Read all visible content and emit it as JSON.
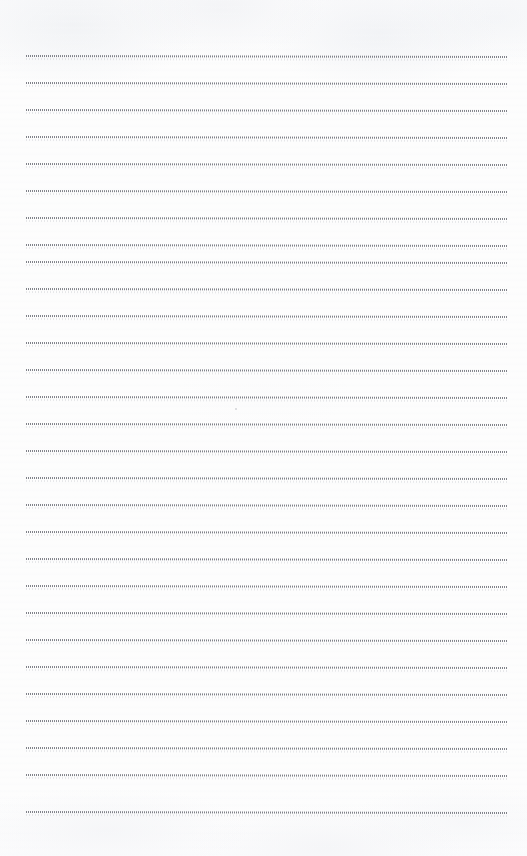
{
  "document": {
    "kind": "scanned-lined-paper",
    "title": "",
    "page_text": "",
    "header_text": "",
    "footer_text": "",
    "page_number": "",
    "annotation_text": "",
    "is_blank": "true"
  },
  "paper": {
    "width_px": 527,
    "height_px": 856,
    "background_color": "#fdfdfd",
    "texture_color": "#f0f1f4",
    "rule_color": "#767880",
    "rule_style": "fine-dotted",
    "rule_count": 29,
    "first_rule_y": 56,
    "rule_spacing_px": 27,
    "rule_left_x": 26,
    "rule_right_x": 507,
    "top_margin_px": 56,
    "bottom_margin_px": 44,
    "skew_deg": 0.12
  },
  "rules": [
    {
      "index": 1,
      "y": 56,
      "left": 26,
      "right": 507
    },
    {
      "index": 2,
      "y": 83,
      "left": 26,
      "right": 507
    },
    {
      "index": 3,
      "y": 110,
      "left": 26,
      "right": 507
    },
    {
      "index": 4,
      "y": 137,
      "left": 26,
      "right": 507
    },
    {
      "index": 5,
      "y": 164,
      "left": 26,
      "right": 507
    },
    {
      "index": 6,
      "y": 191,
      "left": 26,
      "right": 507
    },
    {
      "index": 7,
      "y": 218,
      "left": 26,
      "right": 507
    },
    {
      "index": 8,
      "y": 245,
      "left": 26,
      "right": 507
    },
    {
      "index": 9,
      "y": 262,
      "left": 26,
      "right": 507
    },
    {
      "index": 10,
      "y": 289,
      "left": 26,
      "right": 507
    },
    {
      "index": 11,
      "y": 316,
      "left": 26,
      "right": 507
    },
    {
      "index": 12,
      "y": 343,
      "left": 26,
      "right": 507
    },
    {
      "index": 13,
      "y": 370,
      "left": 26,
      "right": 507
    },
    {
      "index": 14,
      "y": 397,
      "left": 26,
      "right": 507
    },
    {
      "index": 15,
      "y": 424,
      "left": 26,
      "right": 507
    },
    {
      "index": 16,
      "y": 451,
      "left": 26,
      "right": 507
    },
    {
      "index": 17,
      "y": 478,
      "left": 26,
      "right": 507
    },
    {
      "index": 18,
      "y": 505,
      "left": 26,
      "right": 507
    },
    {
      "index": 19,
      "y": 532,
      "left": 26,
      "right": 507
    },
    {
      "index": 20,
      "y": 559,
      "left": 26,
      "right": 507
    },
    {
      "index": 21,
      "y": 586,
      "left": 26,
      "right": 507
    },
    {
      "index": 22,
      "y": 613,
      "left": 26,
      "right": 507
    },
    {
      "index": 23,
      "y": 640,
      "left": 26,
      "right": 507
    },
    {
      "index": 24,
      "y": 667,
      "left": 26,
      "right": 507
    },
    {
      "index": 25,
      "y": 694,
      "left": 26,
      "right": 507
    },
    {
      "index": 26,
      "y": 721,
      "left": 26,
      "right": 507
    },
    {
      "index": 27,
      "y": 748,
      "left": 26,
      "right": 507
    },
    {
      "index": 28,
      "y": 775,
      "left": 26,
      "right": 507
    },
    {
      "index": 29,
      "y": 812,
      "left": 26,
      "right": 507
    }
  ],
  "marks": [
    {
      "name": "scan-speck",
      "x": 235,
      "y": 408
    }
  ]
}
